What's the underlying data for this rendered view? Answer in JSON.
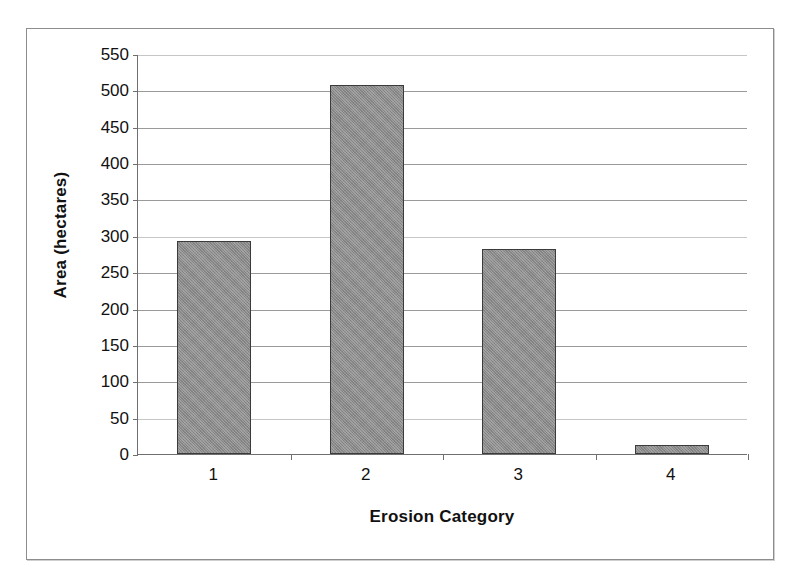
{
  "chart_data": {
    "type": "bar",
    "title": "",
    "subtitle": "",
    "xlabel": "Erosion Category",
    "ylabel": "Area (hectares)",
    "categories": [
      "1",
      "2",
      "3",
      "4"
    ],
    "values": [
      293,
      507,
      282,
      12
    ],
    "series": [
      {
        "name": "Area",
        "values": [
          293,
          507,
          282,
          12
        ]
      }
    ],
    "ylim": [
      0,
      550
    ],
    "ytick_interval": 50,
    "ytick_labels": [
      "0",
      "50",
      "100",
      "150",
      "200",
      "250",
      "300",
      "350",
      "400",
      "450",
      "500",
      "550"
    ],
    "ytick_values": [
      0,
      50,
      100,
      150,
      200,
      250,
      300,
      350,
      400,
      450,
      500,
      550
    ],
    "xtick_labels": [
      "1",
      "2",
      "3",
      "4"
    ],
    "grid": "horizontal",
    "legend": "none",
    "bar_color": "#8a8a8a",
    "bar_outline_color": "#3b3b3b",
    "gridline_color": "#9a9a9a",
    "axis_color": "#6f6f6f",
    "frame_color": "#8d8d8d",
    "background_color": "#ffffff",
    "text_color": "#111111"
  }
}
